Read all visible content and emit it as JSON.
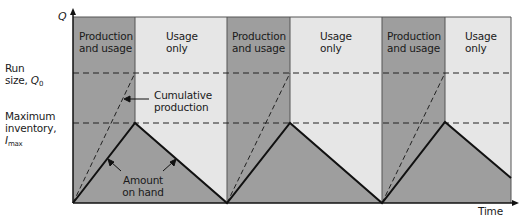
{
  "axes": {
    "y_label": "Q",
    "x_label": "Time"
  },
  "y_levels": {
    "run_size": {
      "line1": "Run",
      "line2": "size, ",
      "symbol": "Q",
      "subscript": "0"
    },
    "max_inventory": {
      "line1": "Maximum",
      "line2": "inventory,",
      "symbol": "I",
      "subscript": "max"
    }
  },
  "bands": [
    {
      "phase": "production",
      "label_line1": "Production",
      "label_line2": "and usage"
    },
    {
      "phase": "usage",
      "label_line1": "Usage",
      "label_line2": "only"
    },
    {
      "phase": "production",
      "label_line1": "Production",
      "label_line2": "and usage"
    },
    {
      "phase": "usage",
      "label_line1": "Usage",
      "label_line2": "only"
    },
    {
      "phase": "production",
      "label_line1": "Production",
      "label_line2": "and usage"
    },
    {
      "phase": "usage",
      "label_line1": "Usage",
      "label_line2": "only"
    }
  ],
  "annotations": {
    "cumulative_production": {
      "line1": "Cumulative",
      "line2": "production"
    },
    "amount_on_hand": {
      "line1": "Amount",
      "line2": "on hand"
    }
  },
  "colors": {
    "production_band": "#9e9e9e",
    "usage_band": "#e6e6e6",
    "inventory_fill": "#9e9e9e",
    "line": "#111111"
  }
}
